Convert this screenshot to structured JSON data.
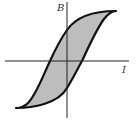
{
  "diagram": {
    "axes": {
      "y_label": "B",
      "x_label": "I"
    },
    "colors": {
      "loop_fill": "#bdbdbd",
      "loop_stroke": "#111111",
      "axis": "#222222"
    },
    "loop": {
      "saturation_top": [
        116,
        11
      ],
      "saturation_bottom": [
        16,
        108
      ],
      "remanence_positive_y": 30,
      "remanence_negative_y": 88,
      "coercivity_negative_x": 50,
      "coercivity_positive_x": 82
    }
  }
}
